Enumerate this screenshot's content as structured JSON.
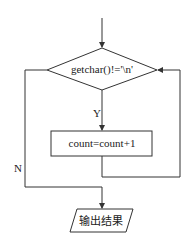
{
  "diagram": {
    "type": "flowchart",
    "nodes": {
      "condition": {
        "shape": "diamond",
        "text": "getchar()!='\\n'"
      },
      "process": {
        "shape": "rectangle",
        "text": "count=count+1"
      },
      "output": {
        "shape": "parallelogram",
        "text": "输出结果"
      }
    },
    "edges": {
      "yes_label": "Y",
      "no_label": "N"
    },
    "colors": {
      "stroke": "#333333",
      "background": "#ffffff"
    }
  }
}
